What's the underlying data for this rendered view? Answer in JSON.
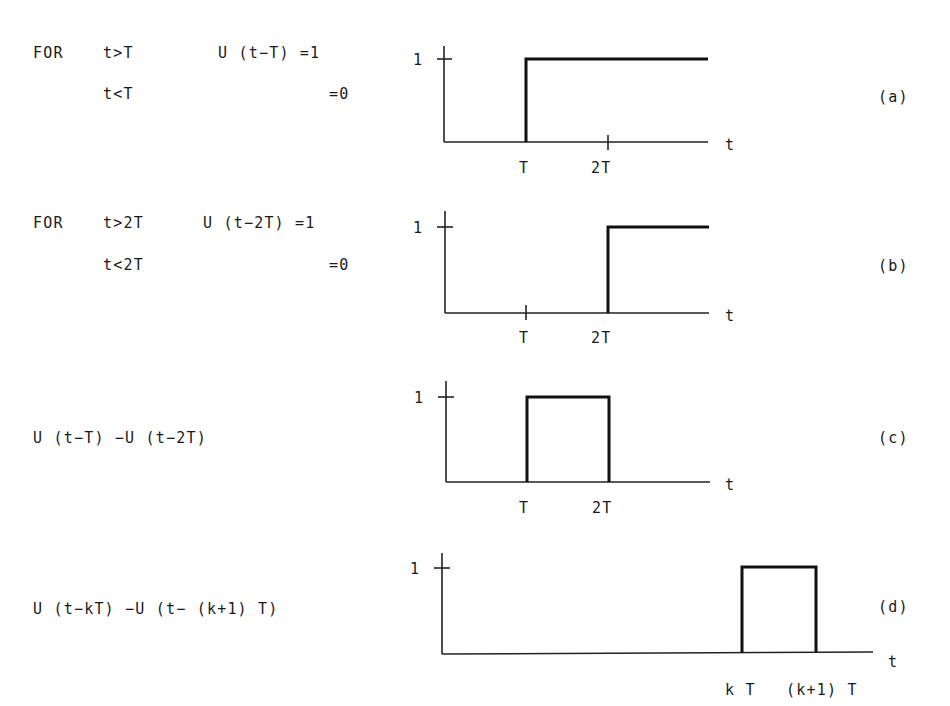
{
  "panels": [
    {
      "id": "a",
      "label": "(a)",
      "equation_lines": [
        "FOR  t>T    U(t-T)=1",
        "     t<T          =0"
      ],
      "eq": {
        "for": "FOR",
        "cond1": "t>T",
        "expr": "U (t−T) =1",
        "cond2": "t<T",
        "zero": "=0"
      },
      "y_tick": "1",
      "x_ticks": [
        "T",
        "2T"
      ],
      "x_axis_label": "t"
    },
    {
      "id": "b",
      "label": "(b)",
      "eq": {
        "for": "FOR",
        "cond1": "t>2T",
        "expr": "U (t−2T) =1",
        "cond2": "t<2T",
        "zero": "=0"
      },
      "y_tick": "1",
      "x_ticks": [
        "T",
        "2T"
      ],
      "x_axis_label": "t"
    },
    {
      "id": "c",
      "label": "(c)",
      "eq": {
        "expr": "U (t−T) −U (t−2T)"
      },
      "y_tick": "1",
      "x_ticks": [
        "T",
        "2T"
      ],
      "x_axis_label": "t"
    },
    {
      "id": "d",
      "label": "(d)",
      "eq": {
        "expr": "U (t−kT) −U (t− (k+1) T)"
      },
      "y_tick": "1",
      "x_ticks": [
        "k T",
        "(k+1) T"
      ],
      "x_axis_label": "t"
    }
  ]
}
